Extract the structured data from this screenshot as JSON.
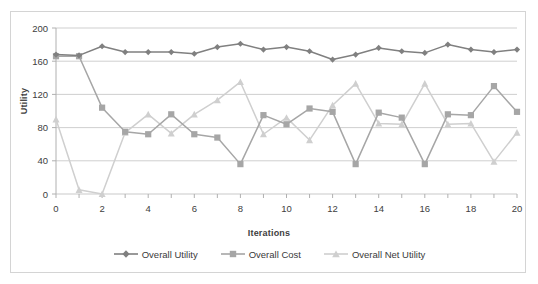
{
  "chart_data": {
    "type": "line",
    "title": "",
    "xlabel": "Iterations",
    "ylabel": "Utility",
    "xlim": [
      0,
      20
    ],
    "ylim": [
      0,
      200
    ],
    "xticks": [
      0,
      2,
      4,
      6,
      8,
      10,
      12,
      14,
      16,
      18,
      20
    ],
    "yticks": [
      0,
      40,
      80,
      120,
      160,
      200
    ],
    "grid": "horizontal",
    "legend_position": "bottom",
    "x": [
      0,
      1,
      2,
      3,
      4,
      5,
      6,
      7,
      8,
      9,
      10,
      11,
      12,
      13,
      14,
      15,
      16,
      17,
      18,
      19,
      20
    ],
    "series": [
      {
        "name": "Overall Utility",
        "color": "#808080",
        "marker": "diamond",
        "values": [
          168,
          167,
          178,
          171,
          171,
          171,
          169,
          177,
          181,
          174,
          177,
          172,
          162,
          168,
          176,
          172,
          170,
          180,
          174,
          171,
          174
        ]
      },
      {
        "name": "Overall Cost",
        "color": "#a6a6a6",
        "marker": "square",
        "values": [
          166,
          166,
          104,
          75,
          72,
          96,
          72,
          68,
          36,
          95,
          84,
          103,
          99,
          36,
          98,
          92,
          36,
          96,
          95,
          130,
          99
        ]
      },
      {
        "name": "Overall Net Utility",
        "color": "#cfcfcf",
        "marker": "triangle",
        "values": [
          90,
          5,
          0,
          74,
          96,
          73,
          96,
          113,
          135,
          72,
          92,
          65,
          107,
          133,
          85,
          84,
          133,
          84,
          85,
          39,
          74
        ]
      }
    ]
  },
  "legend": {
    "items": [
      {
        "label": "Overall Utility"
      },
      {
        "label": "Overall Cost"
      },
      {
        "label": "Overall Net Utility"
      }
    ]
  },
  "axes": {
    "x_title": "Iterations",
    "y_title": "Utility"
  }
}
